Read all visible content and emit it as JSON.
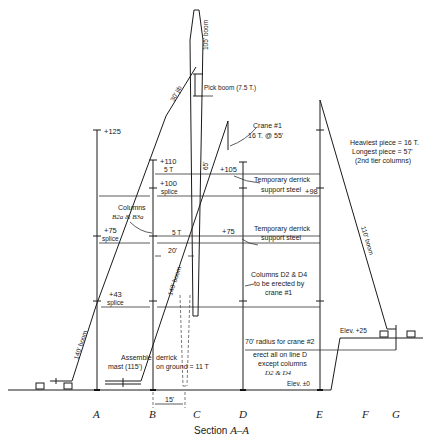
{
  "caption": {
    "prefix": "Section ",
    "section": "A–A"
  },
  "column_lines": [
    "A",
    "B",
    "C",
    "D",
    "E",
    "F",
    "G"
  ],
  "elevations": {
    "a_top": "+125",
    "b_110": "+110",
    "b_110_load": "5 T",
    "b_100": "+100",
    "b_100_note": "splice",
    "a_75": "+75",
    "a_75_note": "splice",
    "a_43": "+43",
    "a_43_note": "splice",
    "d_105": "+105",
    "d_75": "+75",
    "lower_5t": "5 T",
    "e_98": "+98",
    "ground": "Elev. ±0",
    "upper_ground": "Elev. +25"
  },
  "booms": {
    "derrick_top": "105' boom",
    "jib": "30' jib",
    "pick_boom": "Pick boom (7.5 T.)",
    "mast_65": "65'",
    "left_140": "140' boom",
    "mid_140": "140' boom",
    "right_110": "110' boom"
  },
  "notes": {
    "crane1_line1": "Crane #1",
    "crane1_line2": "16 T. @ 55'",
    "temp_support_1a": "Temporary derrick",
    "temp_support_1b": "support steel",
    "temp_support_2a": "Temporary derrick",
    "temp_support_2b": "support steel",
    "columns_b_line1": "Columns",
    "columns_b_line2": "B2a & B3a",
    "columns_d_line1": "Columns D2 & D4",
    "columns_d_line2": "to be erected by",
    "columns_d_line3": "crane #1",
    "radius_crane2": "70' radius for crane #2",
    "erect_line1": "erect all on line D",
    "erect_line2": "except columns",
    "erect_line3": "D2 & D4",
    "assemble_left_1": "Assemble",
    "assemble_left_2": "mast (115')",
    "assemble_right_1": "derrick",
    "assemble_right_2": "on ground = 11 T",
    "dim_20": "20'",
    "dim_15": "15'",
    "heaviest": "Heaviest piece = 16 T.",
    "longest": "Longest piece = 57'",
    "tier": "(2nd tier columns)"
  }
}
